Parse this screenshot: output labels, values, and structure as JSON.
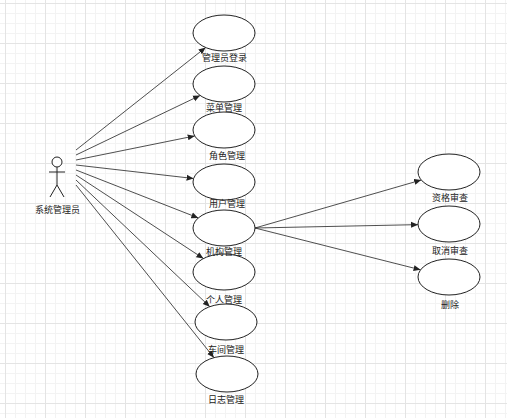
{
  "diagram": {
    "type": "use-case",
    "actor": {
      "label": "系统管理员",
      "x": 57,
      "y": 160
    },
    "use_cases": [
      {
        "id": "uc1",
        "label": "管理员登录",
        "cx": 224,
        "cy": 33
      },
      {
        "id": "uc2",
        "label": "菜单管理",
        "cx": 224,
        "cy": 84
      },
      {
        "id": "uc3",
        "label": "角色管理",
        "cx": 224,
        "cy": 130
      },
      {
        "id": "uc4",
        "label": "用户管理",
        "cx": 224,
        "cy": 182
      },
      {
        "id": "uc5",
        "label": "机构管理",
        "cx": 224,
        "cy": 228
      },
      {
        "id": "uc6",
        "label": "个人管理",
        "cx": 224,
        "cy": 272
      },
      {
        "id": "uc7",
        "label": "车间管理",
        "cx": 226,
        "cy": 322
      },
      {
        "id": "uc8",
        "label": "日志管理",
        "cx": 227,
        "cy": 374
      },
      {
        "id": "uc9",
        "label": "资格审查",
        "cx": 449,
        "cy": 172
      },
      {
        "id": "uc10",
        "label": "取消审查",
        "cx": 449,
        "cy": 224
      },
      {
        "id": "uc11",
        "label": "删除",
        "cx": 449,
        "cy": 277
      }
    ],
    "associations": [
      {
        "from": "actor",
        "to": "uc1"
      },
      {
        "from": "actor",
        "to": "uc2"
      },
      {
        "from": "actor",
        "to": "uc3"
      },
      {
        "from": "actor",
        "to": "uc4"
      },
      {
        "from": "actor",
        "to": "uc5"
      },
      {
        "from": "actor",
        "to": "uc6"
      },
      {
        "from": "actor",
        "to": "uc7"
      },
      {
        "from": "actor",
        "to": "uc8"
      },
      {
        "from": "uc5",
        "to": "uc9"
      },
      {
        "from": "uc5",
        "to": "uc10"
      },
      {
        "from": "uc5",
        "to": "uc11"
      }
    ],
    "colors": {
      "stroke": "#222222",
      "fill": "#ffffff",
      "grid": "#e4e4e4"
    }
  }
}
